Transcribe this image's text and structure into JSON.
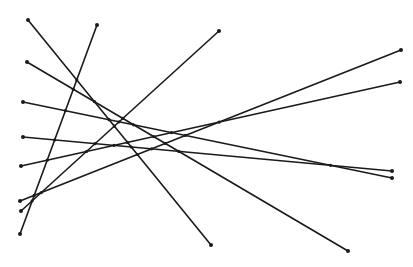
{
  "diagram": {
    "type": "line-segments",
    "stroke_color": "#1a1a1a",
    "stroke_width": 1.6,
    "endpoint_radius": 2,
    "intersection_radius": 1.6,
    "segments": [
      {
        "id": "s1",
        "x1": 28,
        "y1": 20,
        "x2": 211,
        "y2": 245
      },
      {
        "id": "s2",
        "x1": 97,
        "y1": 25,
        "x2": 20,
        "y2": 234
      },
      {
        "id": "s3",
        "x1": 219,
        "y1": 31,
        "x2": 21,
        "y2": 211
      },
      {
        "id": "s4",
        "x1": 27,
        "y1": 62,
        "x2": 348,
        "y2": 251
      },
      {
        "id": "s5",
        "x1": 401,
        "y1": 50,
        "x2": 20,
        "y2": 201
      },
      {
        "id": "s6",
        "x1": 400,
        "y1": 82,
        "x2": 21,
        "y2": 166
      },
      {
        "id": "s7",
        "x1": 23,
        "y1": 102,
        "x2": 392,
        "y2": 178
      },
      {
        "id": "s8",
        "x1": 23,
        "y1": 137,
        "x2": 392,
        "y2": 171
      }
    ]
  }
}
